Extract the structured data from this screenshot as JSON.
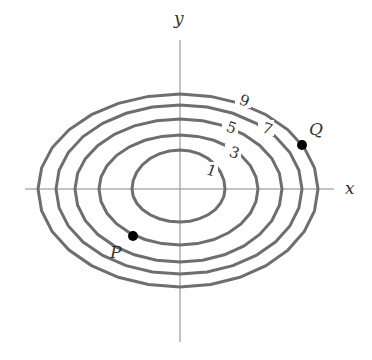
{
  "figure": {
    "type": "contour-plot",
    "axes": {
      "x_label": "x",
      "y_label": "y",
      "origin_px": [
        180,
        189
      ]
    },
    "contours": [
      {
        "level": "1",
        "cx": 180,
        "cy": 189,
        "rx_left": 48,
        "rx_right": 45,
        "ry_top": 39,
        "ry_bottom": 33,
        "label_pos": [
          209,
          175
        ]
      },
      {
        "level": "3",
        "cx": 180,
        "cy": 189,
        "rx_left": 81,
        "rx_right": 78,
        "ry_top": 54,
        "ry_bottom": 56,
        "label_pos": [
          232,
          157
        ]
      },
      {
        "level": "5",
        "cx": 180,
        "cy": 189,
        "rx_left": 105,
        "rx_right": 102,
        "ry_top": 70,
        "ry_bottom": 73,
        "label_pos": [
          229,
          132
        ]
      },
      {
        "level": "7",
        "cx": 180,
        "cy": 189,
        "rx_left": 124,
        "rx_right": 122,
        "ry_top": 84,
        "ry_bottom": 85,
        "label_pos": [
          265,
          133
        ]
      },
      {
        "level": "9",
        "cx": 180,
        "cy": 189,
        "rx_left": 142,
        "rx_right": 138,
        "ry_top": 95,
        "ry_bottom": 98,
        "label_pos": [
          242,
          105
        ]
      }
    ],
    "points": [
      {
        "name": "Q",
        "pos": [
          302,
          145
        ],
        "label_pos": [
          309,
          135
        ]
      },
      {
        "name": "P",
        "pos": [
          133,
          236
        ],
        "label_pos": [
          110,
          258
        ]
      }
    ],
    "colors": {
      "contour": "#6e6e6e",
      "axis": "#888888",
      "point": "#000000"
    }
  }
}
